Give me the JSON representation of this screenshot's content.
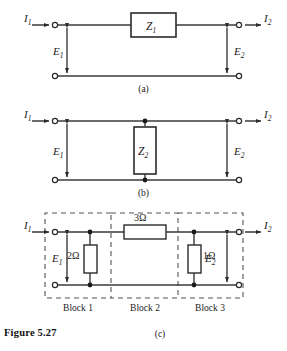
{
  "figure": {
    "number_label": "Figure 5.27",
    "panels": [
      {
        "id": "a",
        "caption": "(a)"
      },
      {
        "id": "b",
        "caption": "(b)"
      },
      {
        "id": "c",
        "caption": "(c)"
      }
    ]
  },
  "panel_a": {
    "caption": "(a)",
    "input_current": "I",
    "input_current_sub": "1",
    "output_current": "I",
    "output_current_sub": "2",
    "input_voltage": "E",
    "input_voltage_sub": "1",
    "output_voltage": "E",
    "output_voltage_sub": "2",
    "element_label": "Z",
    "element_sub": "1",
    "element_type": "series-impedance-box"
  },
  "panel_b": {
    "caption": "(b)",
    "input_current": "I",
    "input_current_sub": "1",
    "output_current": "I",
    "output_current_sub": "2",
    "input_voltage": "E",
    "input_voltage_sub": "1",
    "output_voltage": "E",
    "output_voltage_sub": "2",
    "element_label": "Z",
    "element_sub": "2",
    "element_type": "shunt-impedance-box"
  },
  "panel_c": {
    "caption": "(c)",
    "input_current": "I",
    "input_current_sub": "1",
    "output_current": "I",
    "output_current_sub": "2",
    "input_voltage": "E",
    "input_voltage_sub": "1",
    "output_voltage": "E",
    "output_voltage_sub": "2",
    "components": [
      {
        "value": "2Ω",
        "orientation": "vertical",
        "block": "Block 1"
      },
      {
        "value": "3Ω",
        "orientation": "horizontal",
        "block": "Block 2"
      },
      {
        "value": "1Ω",
        "orientation": "vertical",
        "block": "Block 3"
      }
    ],
    "blocks": [
      {
        "label": "Block 1"
      },
      {
        "label": "Block 2"
      },
      {
        "label": "Block 3"
      }
    ]
  },
  "colors": {
    "wire": "#3a3a3a",
    "box_stroke": "#2b2b2b",
    "dashed": "#555555",
    "text": "#1a1a1a",
    "background": "#ffffff"
  }
}
